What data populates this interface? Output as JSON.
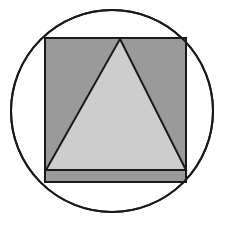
{
  "canvas": {
    "width": 236,
    "height": 228,
    "background": "#ffffff"
  },
  "figure": {
    "stroke_color": "#1a1a1a",
    "stroke_width": 2
  },
  "shapes": {
    "circle": {
      "name": "circle",
      "cx": 112,
      "cy": 111,
      "r": 101,
      "fill": "none",
      "stroke": "#1a1a1a",
      "stroke_width": 2
    },
    "square": {
      "name": "square",
      "x": 45,
      "y": 38,
      "width": 141,
      "height": 144,
      "fill": "#9a9a9a",
      "stroke": "#1a1a1a",
      "stroke_width": 2
    },
    "triangle": {
      "name": "triangle",
      "apex_x": 120,
      "apex_y": 39,
      "base_left_x": 46,
      "base_left_y": 170,
      "base_right_x": 186,
      "base_right_y": 170,
      "points": "120,39 186,170 46,170",
      "fill": "#cdcdcd",
      "stroke": "#1a1a1a",
      "stroke_width": 2
    },
    "base_band": {
      "name": "base-band",
      "x": 46,
      "y": 170,
      "width": 140,
      "height": 12,
      "fill": "#9a9a9a"
    }
  },
  "chart_data": {
    "type": "diagram",
    "elements": [
      {
        "shape": "circle",
        "center": [
          112,
          111
        ],
        "radius": 101,
        "fill": "none",
        "stroke": "#1a1a1a"
      },
      {
        "shape": "square",
        "top_left": [
          45,
          38
        ],
        "bottom_right": [
          186,
          182
        ],
        "side_x": 141,
        "side_y": 144,
        "fill": "#9a9a9a",
        "stroke": "#1a1a1a"
      },
      {
        "shape": "triangle",
        "vertices": [
          [
            120,
            39
          ],
          [
            186,
            170
          ],
          [
            46,
            170
          ]
        ],
        "fill": "#cdcdcd",
        "stroke": "#1a1a1a"
      }
    ]
  }
}
